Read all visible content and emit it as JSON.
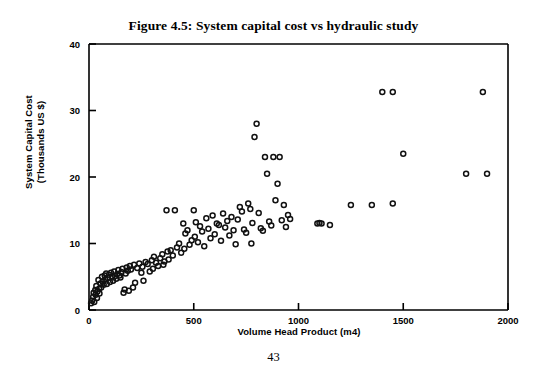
{
  "figure": {
    "title": "Figure 4.5:  System capital cost vs hydraulic study",
    "page_number": "43"
  },
  "axes": {
    "x_title": "Volume Head Product (m4)",
    "y_title_line1": "System Capital Cost",
    "y_title_line2": "(Thousands US $)",
    "x_ticks": [
      "0",
      "500",
      "1000",
      "1500",
      "2000"
    ],
    "y_ticks": [
      "0",
      "10",
      "20",
      "30",
      "40"
    ]
  },
  "colors": {
    "ink": "#000000",
    "paper": "#ffffff",
    "marker_stroke": "#111111"
  },
  "chart_data": {
    "type": "scatter",
    "title": "Figure 4.5:  System capital cost vs hydraulic study",
    "xlabel": "Volume Head Product (m4)",
    "ylabel": "System Capital Cost (Thousands US $)",
    "xlim": [
      0,
      2000
    ],
    "ylim": [
      0,
      40
    ],
    "xticks": [
      0,
      500,
      1000,
      1500,
      2000
    ],
    "yticks": [
      0,
      10,
      20,
      30,
      40
    ],
    "grid": false,
    "legend": "none",
    "marker": "open-circle",
    "series": [
      {
        "name": "systems",
        "points": [
          [
            10,
            1.0
          ],
          [
            15,
            1.4
          ],
          [
            20,
            2.0
          ],
          [
            22,
            2.6
          ],
          [
            25,
            1.2
          ],
          [
            30,
            3.0
          ],
          [
            32,
            2.3
          ],
          [
            35,
            3.6
          ],
          [
            38,
            1.8
          ],
          [
            40,
            2.8
          ],
          [
            45,
            4.5
          ],
          [
            48,
            3.2
          ],
          [
            50,
            2.5
          ],
          [
            55,
            4.0
          ],
          [
            58,
            3.4
          ],
          [
            62,
            5.0
          ],
          [
            65,
            4.3
          ],
          [
            70,
            3.8
          ],
          [
            75,
            5.2
          ],
          [
            78,
            4.6
          ],
          [
            82,
            5.5
          ],
          [
            85,
            3.9
          ],
          [
            90,
            4.8
          ],
          [
            95,
            5.3
          ],
          [
            100,
            4.2
          ],
          [
            105,
            5.6
          ],
          [
            110,
            5.0
          ],
          [
            115,
            4.4
          ],
          [
            120,
            5.8
          ],
          [
            125,
            5.1
          ],
          [
            130,
            4.7
          ],
          [
            135,
            5.4
          ],
          [
            140,
            6.0
          ],
          [
            145,
            5.2
          ],
          [
            150,
            4.9
          ],
          [
            155,
            5.7
          ],
          [
            160,
            6.2
          ],
          [
            165,
            2.6
          ],
          [
            170,
            3.1
          ],
          [
            175,
            5.5
          ],
          [
            180,
            6.4
          ],
          [
            185,
            5.9
          ],
          [
            190,
            2.9
          ],
          [
            195,
            6.6
          ],
          [
            200,
            6.1
          ],
          [
            210,
            3.4
          ],
          [
            215,
            6.8
          ],
          [
            220,
            4.1
          ],
          [
            230,
            6.3
          ],
          [
            240,
            7.0
          ],
          [
            250,
            5.6
          ],
          [
            255,
            6.5
          ],
          [
            260,
            4.4
          ],
          [
            270,
            7.2
          ],
          [
            280,
            6.9
          ],
          [
            290,
            5.8
          ],
          [
            300,
            7.5
          ],
          [
            305,
            6.2
          ],
          [
            310,
            8.0
          ],
          [
            320,
            7.1
          ],
          [
            330,
            6.6
          ],
          [
            340,
            7.8
          ],
          [
            350,
            8.4
          ],
          [
            355,
            6.8
          ],
          [
            360,
            7.3
          ],
          [
            370,
            15.0
          ],
          [
            375,
            8.8
          ],
          [
            380,
            7.6
          ],
          [
            390,
            9.0
          ],
          [
            400,
            8.2
          ],
          [
            410,
            15.0
          ],
          [
            420,
            9.4
          ],
          [
            430,
            10.0
          ],
          [
            440,
            8.6
          ],
          [
            450,
            13.0
          ],
          [
            455,
            9.2
          ],
          [
            460,
            11.5
          ],
          [
            470,
            12.0
          ],
          [
            480,
            9.8
          ],
          [
            490,
            10.5
          ],
          [
            500,
            15.0
          ],
          [
            505,
            11.0
          ],
          [
            510,
            13.2
          ],
          [
            520,
            10.2
          ],
          [
            530,
            12.6
          ],
          [
            540,
            11.8
          ],
          [
            550,
            9.6
          ],
          [
            560,
            13.8
          ],
          [
            570,
            12.2
          ],
          [
            580,
            10.8
          ],
          [
            590,
            14.2
          ],
          [
            600,
            11.4
          ],
          [
            610,
            13.0
          ],
          [
            620,
            12.8
          ],
          [
            630,
            10.4
          ],
          [
            640,
            14.5
          ],
          [
            650,
            12.4
          ],
          [
            660,
            13.4
          ],
          [
            670,
            11.2
          ],
          [
            680,
            14.0
          ],
          [
            690,
            12.0
          ],
          [
            700,
            9.9
          ],
          [
            710,
            13.6
          ],
          [
            720,
            15.5
          ],
          [
            730,
            14.8
          ],
          [
            740,
            12.1
          ],
          [
            750,
            11.6
          ],
          [
            760,
            16.0
          ],
          [
            770,
            15.2
          ],
          [
            775,
            10.0
          ],
          [
            780,
            13.1
          ],
          [
            790,
            26.0
          ],
          [
            800,
            28.0
          ],
          [
            810,
            14.6
          ],
          [
            820,
            12.3
          ],
          [
            830,
            11.9
          ],
          [
            840,
            23.0
          ],
          [
            850,
            20.5
          ],
          [
            860,
            13.3
          ],
          [
            870,
            12.7
          ],
          [
            880,
            23.0
          ],
          [
            890,
            16.5
          ],
          [
            900,
            19.0
          ],
          [
            910,
            23.0
          ],
          [
            920,
            13.5
          ],
          [
            930,
            15.8
          ],
          [
            940,
            12.5
          ],
          [
            950,
            14.3
          ],
          [
            960,
            13.7
          ],
          [
            1090,
            13.0
          ],
          [
            1100,
            13.1
          ],
          [
            1110,
            13.0
          ],
          [
            1150,
            12.8
          ],
          [
            1250,
            15.8
          ],
          [
            1350,
            15.8
          ],
          [
            1400,
            32.8
          ],
          [
            1450,
            32.8
          ],
          [
            1450,
            16.0
          ],
          [
            1500,
            23.5
          ],
          [
            1800,
            20.5
          ],
          [
            1880,
            32.8
          ],
          [
            1900,
            20.5
          ]
        ]
      }
    ]
  }
}
